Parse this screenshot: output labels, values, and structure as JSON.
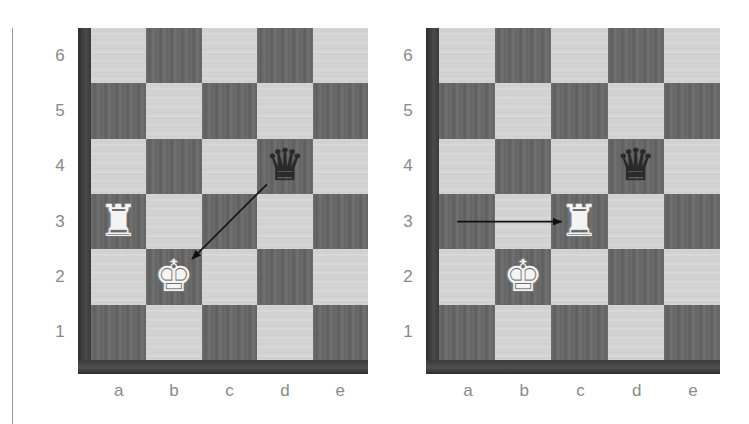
{
  "separator": {
    "visible": true
  },
  "files": [
    "a",
    "b",
    "c",
    "d",
    "e"
  ],
  "ranks": [
    "6",
    "5",
    "4",
    "3",
    "2",
    "1"
  ],
  "colors": {
    "light_square": "#d4d4d4",
    "dark_square": "#666666",
    "frame": "#3a3a3a",
    "label": "#8a8a8a",
    "arrow": "#111111"
  },
  "diagrams": [
    {
      "id": "left",
      "pieces": [
        {
          "square": "a3",
          "type": "rook",
          "color": "white",
          "glyph": "♜"
        },
        {
          "square": "b2",
          "type": "king",
          "color": "white",
          "glyph": "♚"
        },
        {
          "square": "d4",
          "type": "queen",
          "color": "black",
          "glyph": "♛"
        }
      ],
      "arrows": [
        {
          "from": "d4",
          "to": "b2"
        }
      ]
    },
    {
      "id": "right",
      "pieces": [
        {
          "square": "c3",
          "type": "rook",
          "color": "white",
          "glyph": "♜"
        },
        {
          "square": "b2",
          "type": "king",
          "color": "white",
          "glyph": "♚"
        },
        {
          "square": "d4",
          "type": "queen",
          "color": "black",
          "glyph": "♛"
        }
      ],
      "arrows": [
        {
          "from": "a3",
          "to": "c3"
        }
      ]
    }
  ]
}
